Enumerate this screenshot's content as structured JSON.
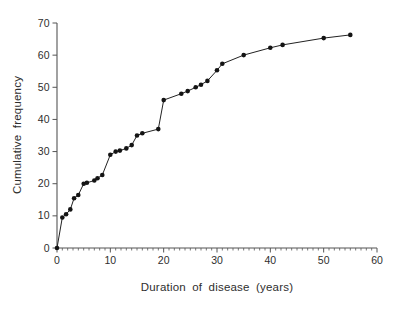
{
  "chart_data": {
    "type": "line",
    "title": "",
    "xlabel": "Duration of disease (years)",
    "ylabel": "Cumulative frequency",
    "xlim": [
      0,
      60
    ],
    "ylim": [
      0,
      70
    ],
    "x_major_ticks": [
      0,
      10,
      20,
      30,
      40,
      50,
      60
    ],
    "x_minor_tick_step": 1,
    "y_major_ticks": [
      0,
      10,
      20,
      30,
      40,
      50,
      60,
      70
    ],
    "grid": "off",
    "legend": "none",
    "marker": "filled-circle",
    "series": [
      {
        "name": "cumulative frequency of disease duration",
        "points": [
          [
            0,
            0
          ],
          [
            1,
            9.5
          ],
          [
            1.7,
            10.5
          ],
          [
            2.5,
            12
          ],
          [
            3.2,
            15.5
          ],
          [
            4,
            16.5
          ],
          [
            5,
            20
          ],
          [
            5.6,
            20.3
          ],
          [
            7,
            21
          ],
          [
            7.6,
            21.7
          ],
          [
            8.5,
            22.7
          ],
          [
            10,
            29
          ],
          [
            11,
            30
          ],
          [
            11.8,
            30.3
          ],
          [
            13,
            31
          ],
          [
            14,
            32
          ],
          [
            15,
            35
          ],
          [
            16,
            35.7
          ],
          [
            19,
            37
          ],
          [
            20,
            46
          ],
          [
            23.3,
            48
          ],
          [
            24.5,
            48.8
          ],
          [
            26,
            50
          ],
          [
            27,
            50.8
          ],
          [
            28.2,
            52
          ],
          [
            30,
            55.3
          ],
          [
            31,
            57.3
          ],
          [
            35,
            60
          ],
          [
            40,
            62.3
          ],
          [
            42.3,
            63.2
          ],
          [
            50,
            65.3
          ],
          [
            55,
            66.3
          ]
        ]
      }
    ],
    "colors": {
      "background": "#ffffff",
      "axis": "#555555",
      "line": "#222222",
      "marker": "#141414",
      "text": "#2e2e2e"
    }
  }
}
